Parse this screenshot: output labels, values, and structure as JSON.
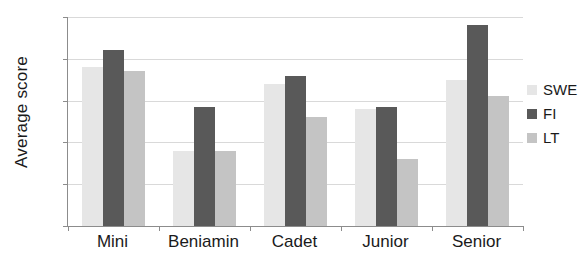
{
  "chart_data": {
    "type": "bar",
    "title": "",
    "subtitle": "",
    "xlabel": "",
    "ylabel": "Average score",
    "ylim": [
      0,
      50
    ],
    "yticks": [
      0,
      10,
      20,
      30,
      40,
      50
    ],
    "grid": true,
    "legend_position": "right",
    "categories": [
      "Mini",
      "Beniamin",
      "Cadet",
      "Junior",
      "Senior"
    ],
    "series": [
      {
        "name": "SWE",
        "color": "#e6e6e6",
        "values": [
          38,
          18,
          34,
          28,
          35
        ]
      },
      {
        "name": "FI",
        "color": "#595959",
        "values": [
          42,
          28.5,
          36,
          28.5,
          48
        ]
      },
      {
        "name": "LT",
        "color": "#c4c4c4",
        "values": [
          37,
          18,
          26,
          16,
          31
        ]
      }
    ]
  },
  "axes": {
    "y_title": "Average score",
    "y_tick_labels": [
      "50",
      "40",
      "30",
      "20",
      "10",
      "0"
    ],
    "x_tick_labels": [
      "Mini",
      "Beniamin",
      "Cadet",
      "Junior",
      "Senior"
    ]
  },
  "legend": {
    "items": [
      {
        "label": "SWE",
        "color": "#e6e6e6"
      },
      {
        "label": "FI",
        "color": "#595959"
      },
      {
        "label": "LT",
        "color": "#c4c4c4"
      }
    ]
  }
}
